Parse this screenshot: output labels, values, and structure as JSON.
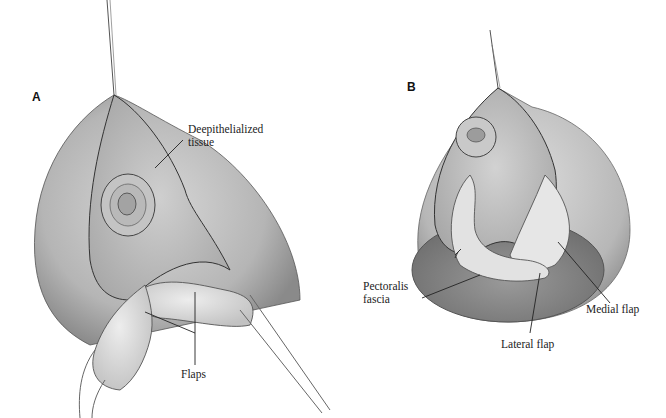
{
  "panels": [
    {
      "letter": "A",
      "labels": {
        "deepithelialized_line1": "Deepithelialized",
        "deepithelialized_line2": "tissue",
        "flaps": "Flaps"
      }
    },
    {
      "letter": "B",
      "labels": {
        "pectoralis_line1": "Pectoralis",
        "pectoralis_line2": "fascia",
        "medial_flap": "Medial flap",
        "lateral_flap": "Lateral flap"
      }
    }
  ],
  "colors": {
    "skin_light": "#d9d9d9",
    "skin_mid": "#b8b8b8",
    "skin_dark": "#8f8f8f",
    "outline": "#3a3a3a",
    "flap": "#e4e4e4",
    "leader": "#222222"
  }
}
